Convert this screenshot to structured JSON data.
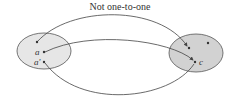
{
  "diagram": {
    "title": "Not one-to-one",
    "domain_set": {
      "fill": "#e6e6e6",
      "elements": [
        {
          "label": "",
          "x": 37,
          "y": 42
        },
        {
          "label": "a",
          "x": 44,
          "y": 52
        },
        {
          "label": "a'",
          "x": 44,
          "y": 62
        }
      ]
    },
    "codomain_set": {
      "fill": "#d2d2d2",
      "elements": [
        {
          "label": "",
          "x": 189,
          "y": 48
        },
        {
          "label": "",
          "x": 208,
          "y": 43
        },
        {
          "label": "c",
          "x": 195,
          "y": 62
        }
      ]
    },
    "mappings": [
      {
        "from": "top element",
        "to": "top-left element of codomain"
      },
      {
        "from": "a",
        "to": "c"
      },
      {
        "from": "a'",
        "to": "c"
      }
    ]
  }
}
